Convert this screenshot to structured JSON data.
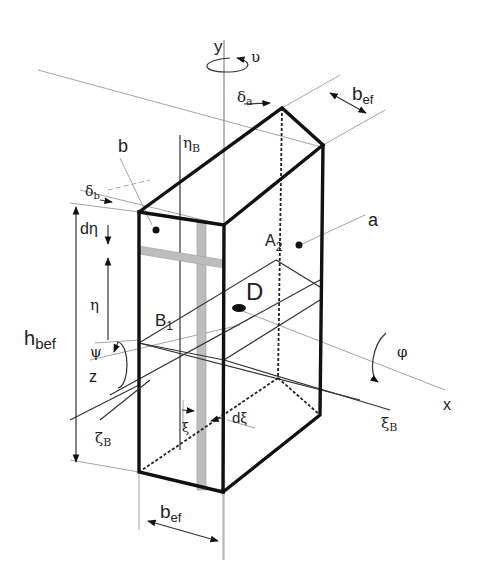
{
  "diagram": {
    "labels": {
      "y_axis": "y",
      "rot_y": "υ",
      "delta_a": "δ",
      "delta_a_sub": "a",
      "b_ef_top": "b",
      "b_ef_top_sub": "ef",
      "b_face": "b",
      "eta_B": "η",
      "eta_B_sub": "B",
      "delta_b": "δ",
      "delta_b_sub": "b",
      "d_eta": "dη",
      "A2": "A",
      "A2_sub": "2",
      "a_face": "a",
      "D": "D",
      "eta": "η",
      "h_bef": "h",
      "h_bef_sub": "bef",
      "B1": "B",
      "B1_sub": "1",
      "psi": "ψ",
      "z_axis": "z",
      "phi": "φ",
      "x_axis": "x",
      "xi_B": "ξ",
      "xi_B_sub": "B",
      "zeta_B": "ζ",
      "zeta_B_sub": "B",
      "xi": "ξ",
      "d_xi": "dξ",
      "b_ef_bottom": "b",
      "b_ef_bottom_sub": "ef"
    },
    "colors": {
      "outline": "#111111",
      "construction": "#9a9a9a",
      "strip": "#bdbdbd"
    }
  }
}
